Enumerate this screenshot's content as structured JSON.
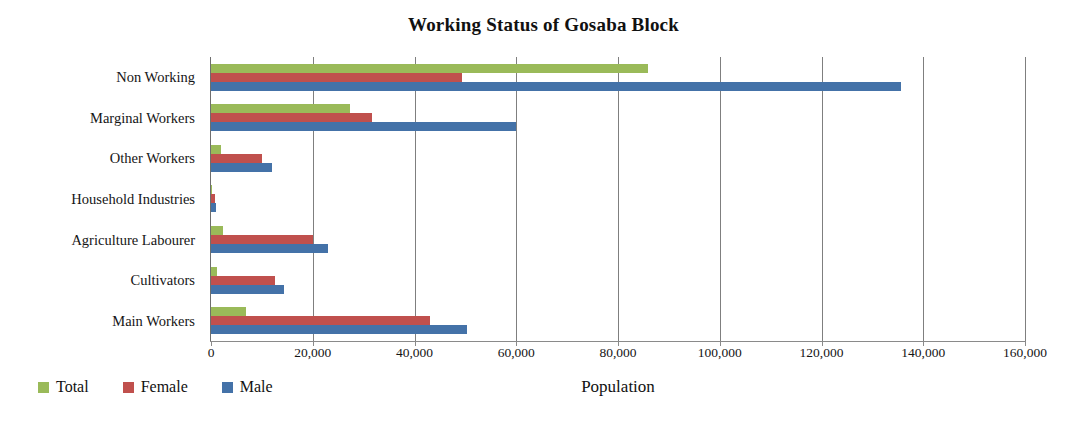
{
  "chart_data": {
    "type": "bar",
    "orientation": "horizontal",
    "title": "Working Status of Gosaba Block",
    "xlabel": "Population",
    "ylabel": "",
    "xlim": [
      0,
      160000
    ],
    "xticks": [
      0,
      20000,
      40000,
      60000,
      80000,
      100000,
      120000,
      140000,
      160000
    ],
    "xticklabels": [
      "0",
      "20,000",
      "40,000",
      "60,000",
      "80,000",
      "100,000",
      "120,000",
      "140,000",
      "160,000"
    ],
    "grid": true,
    "grid_axis": "x",
    "legend_position": "bottom-left",
    "categories": [
      "Non Working",
      "Marginal Workers",
      "Other Workers",
      "Household Industries",
      "Agriculture Labourer",
      "Cultivators",
      "Main Workers"
    ],
    "series": [
      {
        "name": "Total",
        "color": "#9ABA59",
        "values": [
          85900,
          27300,
          2000,
          200,
          2400,
          1200,
          6900
        ]
      },
      {
        "name": "Female",
        "color": "#C0504D",
        "values": [
          49300,
          31600,
          10000,
          800,
          20000,
          12600,
          43000
        ]
      },
      {
        "name": "Male",
        "color": "#4472A8",
        "values": [
          135600,
          60000,
          12000,
          900,
          23000,
          14400,
          50300
        ]
      }
    ]
  },
  "legend": {
    "items": [
      {
        "label": "Total",
        "color": "#9ABA59"
      },
      {
        "label": "Female",
        "color": "#C0504D"
      },
      {
        "label": "Male",
        "color": "#4472A8"
      }
    ]
  }
}
